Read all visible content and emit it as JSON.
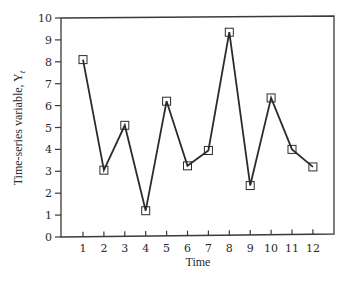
{
  "chart_data": {
    "type": "line",
    "title": "",
    "xlabel": "Time",
    "ylabel": "Time-series variable, Y",
    "ylabel_subscript": "t",
    "x": [
      1,
      2,
      3,
      4,
      5,
      6,
      7,
      8,
      9,
      10,
      11,
      12
    ],
    "series": [
      {
        "name": "Y_t",
        "values": [
          8.1,
          3.05,
          5.1,
          1.2,
          6.2,
          3.25,
          3.95,
          9.35,
          2.35,
          6.35,
          4.0,
          3.2
        ],
        "marker": "square",
        "color": "#2b2b2b"
      }
    ],
    "xticks": [
      "1",
      "2",
      "3",
      "4",
      "5",
      "6",
      "7",
      "8",
      "9",
      "10",
      "11",
      "12"
    ],
    "yticks": [
      "0",
      "1",
      "2",
      "3",
      "4",
      "5",
      "6",
      "7",
      "8",
      "9",
      "10"
    ],
    "ylim": [
      0,
      10
    ],
    "xlim": [
      0,
      13
    ],
    "grid": false,
    "legend": "none"
  }
}
